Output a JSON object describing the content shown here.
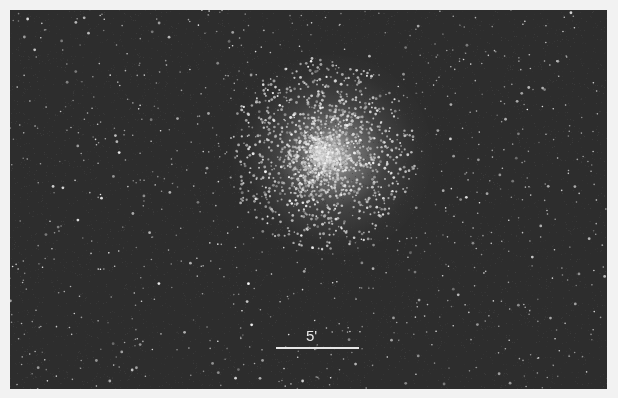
{
  "image": {
    "subject": "globular star cluster on dark star field",
    "scale_bar": {
      "label": "5'"
    }
  }
}
